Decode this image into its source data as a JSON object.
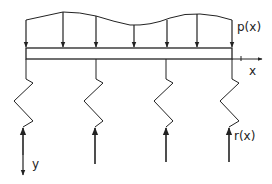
{
  "diagram": {
    "labels": {
      "load": "p(x)",
      "reaction": "r(x)",
      "x_axis": "x",
      "y_axis": "y"
    },
    "colors": {
      "stroke": "#222222",
      "background": "#ffffff"
    },
    "beam": {
      "x_start": 26,
      "x_end": 232,
      "y_top": 48,
      "y_bottom": 59
    },
    "load_arrows_x": [
      26,
      63,
      96,
      134,
      164,
      196,
      232
    ],
    "springs_x": [
      26,
      96,
      166,
      232
    ],
    "reaction_arrows_x": [
      23,
      95,
      166,
      229
    ]
  }
}
